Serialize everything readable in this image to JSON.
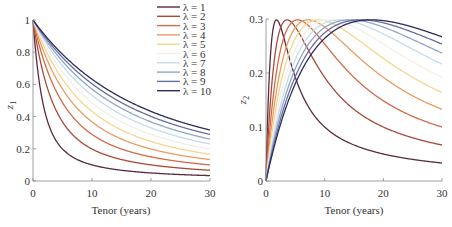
{
  "chart_data": [
    {
      "type": "line",
      "title": "",
      "xlabel": "Tenor (years)",
      "ylabel": "z1",
      "ylabel_main": "z",
      "ylabel_sub": "1",
      "xlim": [
        0,
        30
      ],
      "ylim": [
        0,
        1
      ],
      "xticks": [
        "0",
        "10",
        "20",
        "30"
      ],
      "yticks": [
        "0",
        "0.2",
        "0.4",
        "0.6",
        "0.8",
        "1"
      ],
      "grid": false,
      "legend_position": "upper right",
      "formula": "z1(t) = (1 - exp(-t/λ)) / (t/λ)",
      "series": [
        {
          "name": "λ = 1",
          "lambda": 1,
          "x": [
            0,
            1,
            2,
            3,
            5,
            10,
            15,
            20,
            25,
            30
          ],
          "values": [
            1.0,
            0.632,
            0.432,
            0.317,
            0.199,
            0.1,
            0.067,
            0.05,
            0.04,
            0.033
          ]
        },
        {
          "name": "λ = 2",
          "lambda": 2,
          "x": [
            0,
            1,
            2,
            3,
            5,
            10,
            15,
            20,
            25,
            30
          ],
          "values": [
            1.0,
            0.787,
            0.632,
            0.518,
            0.367,
            0.199,
            0.133,
            0.1,
            0.08,
            0.067
          ]
        },
        {
          "name": "λ = 3",
          "lambda": 3,
          "x": [
            0,
            1,
            2,
            3,
            5,
            10,
            15,
            20,
            25,
            30
          ],
          "values": [
            1.0,
            0.85,
            0.73,
            0.632,
            0.487,
            0.289,
            0.199,
            0.15,
            0.12,
            0.1
          ]
        },
        {
          "name": "λ = 4",
          "lambda": 4,
          "x": [
            0,
            1,
            2,
            3,
            5,
            10,
            15,
            20,
            25,
            30
          ],
          "values": [
            1.0,
            0.885,
            0.787,
            0.703,
            0.571,
            0.368,
            0.261,
            0.199,
            0.16,
            0.133
          ]
        },
        {
          "name": "λ = 5",
          "lambda": 5,
          "x": [
            0,
            1,
            2,
            3,
            5,
            10,
            15,
            20,
            25,
            30
          ],
          "values": [
            1.0,
            0.906,
            0.824,
            0.752,
            0.632,
            0.432,
            0.317,
            0.245,
            0.199,
            0.167
          ]
        },
        {
          "name": "λ = 6",
          "lambda": 6,
          "x": [
            0,
            1,
            2,
            3,
            5,
            10,
            15,
            20,
            25,
            30
          ],
          "values": [
            1.0,
            0.921,
            0.85,
            0.787,
            0.679,
            0.487,
            0.366,
            0.289,
            0.237,
            0.199
          ]
        },
        {
          "name": "λ = 7",
          "lambda": 7,
          "x": [
            0,
            1,
            2,
            3,
            5,
            10,
            15,
            20,
            25,
            30
          ],
          "values": [
            1.0,
            0.932,
            0.87,
            0.813,
            0.714,
            0.532,
            0.411,
            0.329,
            0.271,
            0.23
          ]
        },
        {
          "name": "λ = 8",
          "lambda": 8,
          "x": [
            0,
            1,
            2,
            3,
            5,
            10,
            15,
            20,
            25,
            30
          ],
          "values": [
            1.0,
            0.94,
            0.885,
            0.834,
            0.743,
            0.57,
            0.45,
            0.365,
            0.304,
            0.259
          ]
        },
        {
          "name": "λ = 9",
          "lambda": 9,
          "x": [
            0,
            1,
            2,
            3,
            5,
            10,
            15,
            20,
            25,
            30
          ],
          "values": [
            1.0,
            0.946,
            0.897,
            0.85,
            0.766,
            0.603,
            0.485,
            0.398,
            0.335,
            0.288
          ]
        },
        {
          "name": "λ = 10",
          "lambda": 10,
          "x": [
            0,
            1,
            2,
            3,
            5,
            10,
            15,
            20,
            25,
            30
          ],
          "values": [
            1.0,
            0.952,
            0.906,
            0.864,
            0.787,
            0.632,
            0.518,
            0.432,
            0.367,
            0.317
          ]
        }
      ]
    },
    {
      "type": "line",
      "title": "",
      "xlabel": "Tenor (years)",
      "ylabel": "z2",
      "ylabel_main": "z",
      "ylabel_sub": "2",
      "xlim": [
        0,
        30
      ],
      "ylim": [
        0,
        0.3
      ],
      "xticks": [
        "0",
        "10",
        "20",
        "30"
      ],
      "yticks": [
        "0",
        "0.1",
        "0.2",
        "0.3"
      ],
      "grid": false,
      "formula": "z2(t) = (1 - exp(-t/λ)) / (t/λ) - exp(-t/λ)",
      "series": [
        {
          "name": "λ = 1",
          "lambda": 1,
          "x": [
            0,
            1,
            1.79,
            3,
            5,
            10,
            15,
            20,
            25,
            30
          ],
          "values": [
            0,
            0.264,
            0.298,
            0.267,
            0.192,
            0.1,
            0.067,
            0.05,
            0.04,
            0.033
          ]
        },
        {
          "name": "λ = 2",
          "lambda": 2,
          "x": [
            0,
            1,
            3.59,
            5,
            10,
            15,
            20,
            25,
            30
          ],
          "values": [
            0,
            0.18,
            0.298,
            0.285,
            0.192,
            0.133,
            0.1,
            0.08,
            0.067
          ]
        },
        {
          "name": "λ = 3",
          "lambda": 3,
          "x": [
            0,
            1,
            5.38,
            10,
            15,
            20,
            25,
            30
          ],
          "values": [
            0,
            0.134,
            0.298,
            0.254,
            0.192,
            0.149,
            0.12,
            0.1
          ]
        },
        {
          "name": "λ = 4",
          "lambda": 4,
          "x": [
            0,
            1,
            7.17,
            10,
            15,
            20,
            25,
            30
          ],
          "values": [
            0,
            0.106,
            0.298,
            0.286,
            0.238,
            0.192,
            0.158,
            0.133
          ]
        },
        {
          "name": "λ = 5",
          "lambda": 5,
          "x": [
            0,
            1,
            8.96,
            10,
            15,
            20,
            25,
            30
          ],
          "values": [
            0,
            0.088,
            0.298,
            0.297,
            0.267,
            0.227,
            0.192,
            0.165
          ]
        },
        {
          "name": "λ = 6",
          "lambda": 6,
          "x": [
            0,
            1,
            10.76,
            15,
            20,
            25,
            30
          ],
          "values": [
            0,
            0.075,
            0.298,
            0.284,
            0.253,
            0.221,
            0.192
          ]
        },
        {
          "name": "λ = 7",
          "lambda": 7,
          "x": [
            0,
            1,
            12.55,
            15,
            20,
            25,
            30
          ],
          "values": [
            0,
            0.065,
            0.298,
            0.294,
            0.272,
            0.243,
            0.216
          ]
        },
        {
          "name": "λ = 8",
          "lambda": 8,
          "x": [
            0,
            1,
            14.34,
            15,
            20,
            25,
            30
          ],
          "values": [
            0,
            0.058,
            0.298,
            0.297,
            0.283,
            0.26,
            0.235
          ]
        },
        {
          "name": "λ = 9",
          "lambda": 9,
          "x": [
            0,
            1,
            16.13,
            20,
            25,
            30
          ],
          "values": [
            0,
            0.052,
            0.298,
            0.29,
            0.273,
            0.252
          ]
        },
        {
          "name": "λ = 10",
          "lambda": 10,
          "x": [
            0,
            1,
            17.93,
            20,
            25,
            30
          ],
          "values": [
            0,
            0.047,
            0.298,
            0.297,
            0.285,
            0.267
          ]
        }
      ]
    }
  ],
  "legend": {
    "entries": [
      "λ = 1",
      "λ = 2",
      "λ = 3",
      "λ = 4",
      "λ = 5",
      "λ = 6",
      "λ = 7",
      "λ = 8",
      "λ = 9",
      "λ = 10"
    ],
    "colors": [
      "#5a2a3e",
      "#a84a3a",
      "#d46a48",
      "#eb9c60",
      "#f6d68e",
      "#f3efe6",
      "#c6dbee",
      "#8fa6c6",
      "#676fa0",
      "#2b2c5c"
    ]
  },
  "left_plot": {
    "xlabel": "Tenor (years)",
    "ylabel_main": "z",
    "ylabel_sub": "1",
    "xticks": [
      "0",
      "10",
      "20",
      "30"
    ],
    "yticks": [
      "0",
      "0.2",
      "0.4",
      "0.6",
      "0.8",
      "1"
    ]
  },
  "right_plot": {
    "xlabel": "Tenor (years)",
    "ylabel_main": "z",
    "ylabel_sub": "2",
    "xticks": [
      "0",
      "10",
      "20",
      "30"
    ],
    "yticks": [
      "0",
      "0.1",
      "0.2",
      "0.3"
    ]
  }
}
